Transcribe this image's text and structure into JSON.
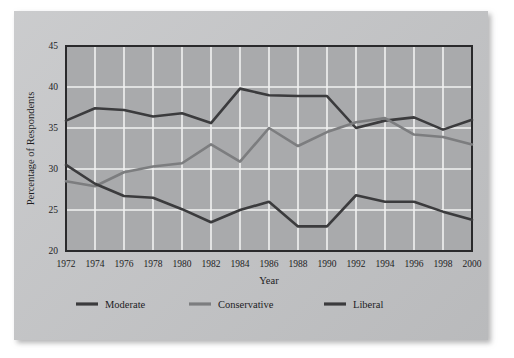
{
  "chart_data": {
    "type": "line",
    "title": "",
    "xlabel": "Year",
    "ylabel": "Percentage of Respondents",
    "x": [
      1972,
      1974,
      1976,
      1978,
      1980,
      1982,
      1984,
      1986,
      1988,
      1990,
      1992,
      1994,
      1996,
      1998,
      2000
    ],
    "categories": [
      "1972",
      "1974",
      "1976",
      "1978",
      "1980",
      "1982",
      "1984",
      "1986",
      "1988",
      "1990",
      "1992",
      "1994",
      "1996",
      "1998",
      "2000"
    ],
    "xlim": [
      1972,
      2000
    ],
    "ylim": [
      20,
      45
    ],
    "yticks": [
      20,
      25,
      30,
      35,
      40,
      45
    ],
    "ytick_labels": [
      "20",
      "25",
      "30",
      "35",
      "40",
      "45"
    ],
    "grid": true,
    "grid_color": "#f2f2f2",
    "legend_position": "bottom",
    "plot_background": "#a9aaac",
    "series": [
      {
        "name": "Moderate",
        "color": "#3b3b3d",
        "values": [
          35.9,
          37.4,
          37.2,
          36.4,
          36.8,
          35.6,
          39.8,
          39.0,
          38.9,
          38.9,
          35.0,
          35.9,
          36.3,
          34.8,
          36.0
        ]
      },
      {
        "name": "Conservative",
        "color": "#7c7d7f",
        "values": [
          28.5,
          27.9,
          29.6,
          30.3,
          30.7,
          33.0,
          30.9,
          35.0,
          32.8,
          34.5,
          35.7,
          36.2,
          34.2,
          33.9,
          33.0
        ]
      },
      {
        "name": "Liberal",
        "color": "#3b3b3d",
        "values": [
          30.5,
          28.2,
          26.7,
          26.5,
          25.1,
          23.5,
          25.0,
          26.0,
          23.0,
          23.0,
          26.8,
          26.0,
          26.0,
          24.8,
          23.8
        ]
      }
    ]
  },
  "legend": {
    "items": [
      {
        "label": "Moderate",
        "color": "#3b3b3d"
      },
      {
        "label": "Conservative",
        "color": "#7c7d7f"
      },
      {
        "label": "Liberal",
        "color": "#3b3b3d"
      }
    ]
  }
}
